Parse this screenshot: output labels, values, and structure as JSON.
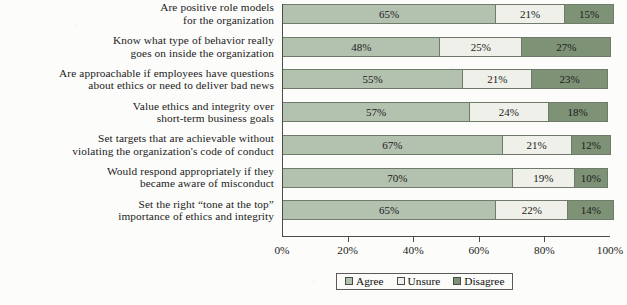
{
  "chart_data": {
    "type": "bar",
    "orientation": "horizontal",
    "stacked": true,
    "stacked_mode": "percent",
    "title": "",
    "subtitle": "",
    "xlabel": "",
    "ylabel": "",
    "xlim": [
      0,
      100
    ],
    "xticks": [
      0,
      20,
      40,
      60,
      80,
      100
    ],
    "xticklabels": [
      "0%",
      "20%",
      "40%",
      "60%",
      "80%",
      "100%"
    ],
    "grid": false,
    "legend_position": "bottom-center",
    "categories": [
      "Are positive role models\nfor the organization",
      "Know what type of behavior really\ngoes on inside the organization",
      "Are approachable if employees have questions\nabout ethics or need to deliver bad news",
      "Value ethics and integrity over\nshort-term business goals",
      "Set targets that are achievable without\nviolating the organization's code of conduct",
      "Would respond appropriately if they\nbecame aware of misconduct",
      "Set the right “tone at the top”\nimportance of ethics and integrity"
    ],
    "series": [
      {
        "name": "Agree",
        "color": "#b3c1af",
        "values": [
          65,
          48,
          55,
          57,
          67,
          70,
          65
        ]
      },
      {
        "name": "Unsure",
        "color": "#eef0e9",
        "values": [
          21,
          25,
          21,
          24,
          21,
          19,
          22
        ]
      },
      {
        "name": "Disagree",
        "color": "#7e9276",
        "values": [
          15,
          27,
          23,
          18,
          12,
          10,
          14
        ]
      }
    ],
    "data_labels": [
      [
        "65%",
        "21%",
        "15%"
      ],
      [
        "48%",
        "25%",
        "27%"
      ],
      [
        "55%",
        "21%",
        "23%"
      ],
      [
        "57%",
        "24%",
        "18%"
      ],
      [
        "67%",
        "21%",
        "12%"
      ],
      [
        "70%",
        "19%",
        "10%"
      ],
      [
        "65%",
        "22%",
        "14%"
      ]
    ]
  },
  "legend": {
    "items": [
      {
        "label": "Agree"
      },
      {
        "label": "Unsure"
      },
      {
        "label": "Disagree"
      }
    ]
  }
}
